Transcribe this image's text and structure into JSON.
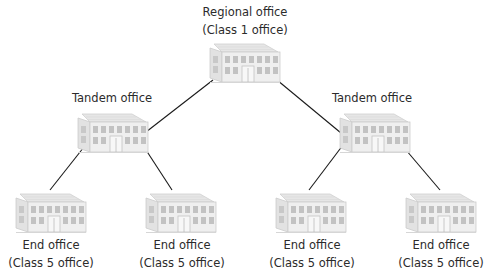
{
  "diagram": {
    "type": "hierarchy",
    "title": "",
    "colors": {
      "line": "#1a1a1a",
      "building_face": "#ececec",
      "building_roof": "#dcdcdc",
      "building_windows": "#bdbdbd",
      "text": "#2b2b2b"
    },
    "nodes": {
      "regional": {
        "name": "Regional office",
        "class": "(Class 1 office)",
        "icon": "office-building-icon"
      },
      "tandem_left": {
        "name": "Tandem office",
        "icon": "office-building-icon"
      },
      "tandem_right": {
        "name": "Tandem office",
        "icon": "office-building-icon"
      },
      "end_1": {
        "name": "End office",
        "class": "(Class 5 office)",
        "icon": "office-building-icon"
      },
      "end_2": {
        "name": "End office",
        "class": "(Class 5 office)",
        "icon": "office-building-icon"
      },
      "end_3": {
        "name": "End office",
        "class": "(Class 5 office)",
        "icon": "office-building-icon"
      },
      "end_4": {
        "name": "End office",
        "class": "(Class 5 office)",
        "icon": "office-building-icon"
      }
    },
    "edges": [
      {
        "from": "regional",
        "to": "tandem_left"
      },
      {
        "from": "regional",
        "to": "tandem_right"
      },
      {
        "from": "tandem_left",
        "to": "end_1"
      },
      {
        "from": "tandem_left",
        "to": "end_2"
      },
      {
        "from": "tandem_right",
        "to": "end_3"
      },
      {
        "from": "tandem_right",
        "to": "end_4"
      }
    ]
  }
}
